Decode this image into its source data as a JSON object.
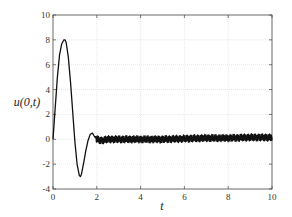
{
  "chart_data": {
    "type": "line",
    "title": "",
    "xlabel": "t",
    "ylabel": "u(0,t)",
    "xlim": [
      0,
      10
    ],
    "ylim": [
      -4,
      10
    ],
    "grid": true,
    "legend": null,
    "xticks": [
      0,
      2,
      4,
      6,
      8,
      10
    ],
    "yticks": [
      -4,
      -2,
      0,
      2,
      4,
      6,
      8,
      10
    ],
    "xtick_labels": [
      "0",
      "2",
      "4",
      "6",
      "8",
      "10"
    ],
    "ytick_labels": [
      "-4",
      "-2",
      "0",
      "2",
      "4",
      "6",
      "8",
      "10"
    ],
    "series": [
      {
        "name": "u(0,t)",
        "color": "#111111",
        "x": [
          0,
          0.1,
          0.2,
          0.3,
          0.4,
          0.5,
          0.55,
          0.6,
          0.7,
          0.8,
          0.9,
          1.0,
          1.1,
          1.2,
          1.25,
          1.3,
          1.4,
          1.5,
          1.6,
          1.7,
          1.8,
          1.9,
          2.0,
          2.2,
          2.5,
          3,
          4,
          5,
          6,
          7,
          8,
          9,
          10
        ],
        "y": [
          0,
          2.5,
          5.0,
          6.8,
          7.7,
          8.0,
          8.0,
          7.8,
          6.6,
          4.6,
          2.2,
          -0.2,
          -2.0,
          -2.9,
          -3.0,
          -2.8,
          -1.9,
          -0.9,
          -0.1,
          0.4,
          0.5,
          0.2,
          0.0,
          -0.1,
          0.0,
          0.0,
          0.0,
          0.0,
          0.05,
          0.1,
          0.1,
          0.15,
          0.15
        ],
        "noise_amplitude_after_t2": 0.3
      }
    ]
  },
  "axes": {
    "xlabel": "t",
    "ylabel": "u(0,t)"
  }
}
